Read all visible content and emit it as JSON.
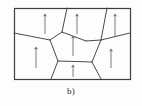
{
  "figure": {
    "caption": "b)",
    "kind": "polycrystalline-grain-structure-diagram",
    "background_color": "#fdfdfd",
    "line_color": "#4a4a4a",
    "arrow_color": "#6e6e6e",
    "border_color": "#3d3d3d"
  },
  "chart_data": {
    "type": "diagram",
    "title": "b)",
    "xlabel": "",
    "ylabel": "",
    "frame": {
      "x": 14,
      "y": 8,
      "width": 116,
      "height": 71
    },
    "grain_boundaries": [
      {
        "name": "left-edge-to-left-triple-junction",
        "points": [
          [
            14,
            33
          ],
          [
            50,
            40
          ]
        ]
      },
      {
        "name": "left-triple-junction-to-pentagon-upper-left",
        "points": [
          [
            50,
            40
          ],
          [
            62,
            32
          ]
        ]
      },
      {
        "name": "pentagon-upper-left-to-top-edge",
        "points": [
          [
            62,
            32
          ],
          [
            67,
            8
          ]
        ]
      },
      {
        "name": "pentagon-upper-left-to-pentagon-top",
        "points": [
          [
            62,
            32
          ],
          [
            86,
            41
          ]
        ]
      },
      {
        "name": "pentagon-top-to-right-triple-junction",
        "points": [
          [
            86,
            41
          ],
          [
            101,
            40
          ]
        ]
      },
      {
        "name": "right-diagonal-top-edge-to-junction",
        "points": [
          [
            107,
            8
          ],
          [
            101,
            40
          ]
        ]
      },
      {
        "name": "junction-to-right-edge",
        "points": [
          [
            101,
            40
          ],
          [
            130,
            33
          ]
        ]
      },
      {
        "name": "junction-down-to-lower-right",
        "points": [
          [
            101,
            40
          ],
          [
            92,
            62
          ]
        ]
      },
      {
        "name": "pentagon-lower-right-to-bottom-edge",
        "points": [
          [
            92,
            62
          ],
          [
            101,
            79
          ]
        ]
      },
      {
        "name": "pentagon-bottom-edge",
        "points": [
          [
            92,
            62
          ],
          [
            58,
            61
          ]
        ]
      },
      {
        "name": "pentagon-lower-left-to-left-junction",
        "points": [
          [
            58,
            61
          ],
          [
            50,
            40
          ]
        ]
      },
      {
        "name": "pentagon-lower-left-to-bottom-edge",
        "points": [
          [
            58,
            61
          ],
          [
            51,
            79
          ]
        ]
      }
    ],
    "arrows": [
      {
        "name": "arrow-grain-top-left",
        "x": 45,
        "y_tail": 34,
        "y_head": 15,
        "direction": "up"
      },
      {
        "name": "arrow-grain-top-center",
        "x": 77,
        "y_tail": 34,
        "y_head": 15,
        "direction": "up"
      },
      {
        "name": "arrow-grain-top-right",
        "x": 115,
        "y_tail": 36,
        "y_head": 15,
        "direction": "up"
      },
      {
        "name": "arrow-grain-left",
        "x": 36,
        "y_tail": 68,
        "y_head": 48,
        "direction": "up"
      },
      {
        "name": "arrow-grain-center",
        "x": 73,
        "y_tail": 56,
        "y_head": 37,
        "direction": "up"
      },
      {
        "name": "arrow-grain-right",
        "x": 111,
        "y_tail": 68,
        "y_head": 50,
        "direction": "up"
      },
      {
        "name": "arrow-grain-bottom",
        "x": 73,
        "y_tail": 77,
        "y_head": 66,
        "direction": "up"
      }
    ],
    "arrow_count": 7,
    "grid": false,
    "legend": null
  }
}
